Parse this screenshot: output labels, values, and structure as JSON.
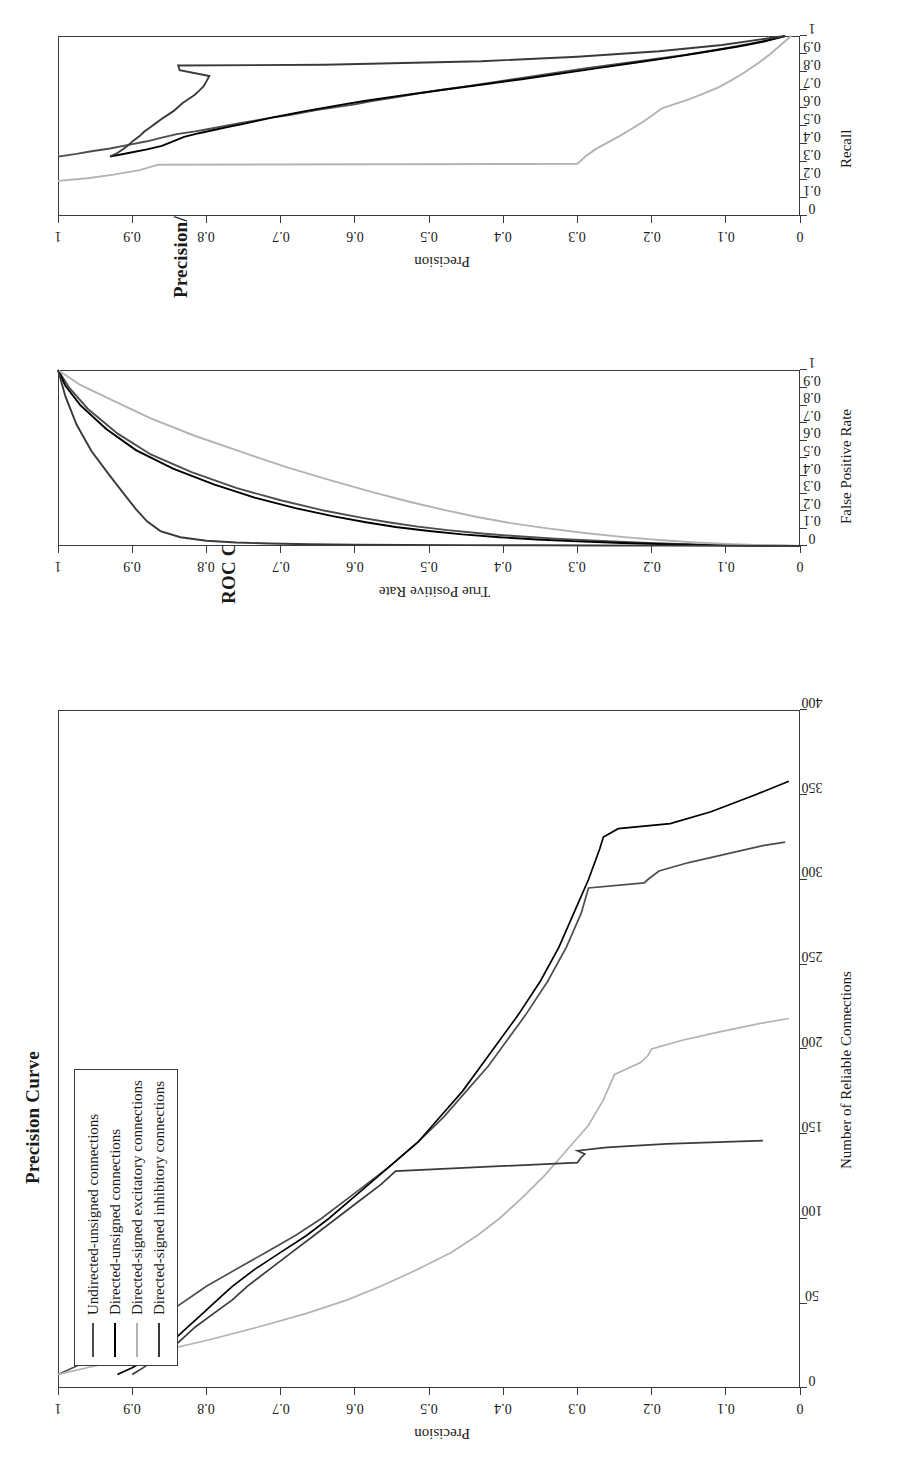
{
  "figure": {
    "orientation": "rotated-90-ccw",
    "background": "#ffffff",
    "ink": "#1a1a1a"
  },
  "legend": {
    "name": "series-legend",
    "items": [
      {
        "label": "Undirected-unsigned connections",
        "color": "#4d4d4d"
      },
      {
        "label": "Directed-unsigned connections",
        "color": "#000000"
      },
      {
        "label": "Directed-signed excitatory connections",
        "color": "#b3b3b3"
      },
      {
        "label": "Directed-signed inhibitory connections",
        "color": "#3a3a3a"
      }
    ]
  },
  "chart_data": [
    {
      "id": "precision-curve",
      "type": "line",
      "title": "Precision Curve",
      "xlabel": "Number of Reliable Connections",
      "ylabel": "Precision",
      "xlim": [
        0,
        400
      ],
      "ylim": [
        0,
        1
      ],
      "xticks": [
        "0",
        "50",
        "100",
        "150",
        "200",
        "250",
        "300",
        "350",
        "400"
      ],
      "yticks": [
        "0",
        "0.1",
        "0.2",
        "0.3",
        "0.4",
        "0.5",
        "0.6",
        "0.7",
        "0.8",
        "0.9",
        "1"
      ],
      "grid": false,
      "legend_position": "top-left",
      "series": [
        {
          "name": "Undirected-unsigned connections",
          "color": "#4d4d4d",
          "x": [
            8,
            12,
            18,
            24,
            30,
            36,
            42,
            48,
            54,
            60,
            70,
            80,
            90,
            100,
            115,
            130,
            145,
            160,
            175,
            190,
            205,
            220,
            240,
            260,
            280,
            295,
            298,
            300,
            305,
            310,
            315,
            320,
            322
          ],
          "y": [
            1.0,
            0.98,
            0.95,
            0.93,
            0.9,
            0.88,
            0.86,
            0.84,
            0.82,
            0.8,
            0.76,
            0.72,
            0.68,
            0.645,
            0.6,
            0.555,
            0.515,
            0.48,
            0.45,
            0.42,
            0.395,
            0.37,
            0.34,
            0.315,
            0.295,
            0.285,
            0.21,
            0.205,
            0.19,
            0.15,
            0.1,
            0.05,
            0.02
          ]
        },
        {
          "name": "Directed-unsigned connections",
          "color": "#000000",
          "x": [
            8,
            12,
            18,
            24,
            30,
            36,
            42,
            48,
            54,
            60,
            70,
            80,
            90,
            100,
            115,
            130,
            145,
            160,
            175,
            190,
            205,
            220,
            240,
            260,
            280,
            300,
            318,
            325,
            330,
            333,
            340,
            350,
            358
          ],
          "y": [
            0.92,
            0.9,
            0.875,
            0.855,
            0.84,
            0.825,
            0.81,
            0.795,
            0.78,
            0.765,
            0.735,
            0.7,
            0.665,
            0.635,
            0.595,
            0.555,
            0.515,
            0.485,
            0.455,
            0.43,
            0.405,
            0.38,
            0.35,
            0.325,
            0.305,
            0.285,
            0.27,
            0.265,
            0.245,
            0.175,
            0.12,
            0.06,
            0.015
          ]
        },
        {
          "name": "Directed-signed excitatory connections",
          "color": "#b3b3b3",
          "x": [
            8,
            14,
            20,
            28,
            36,
            44,
            52,
            60,
            70,
            80,
            90,
            100,
            112,
            125,
            140,
            155,
            170,
            185,
            192,
            196,
            200,
            205,
            210,
            215,
            218
          ],
          "y": [
            1.0,
            0.94,
            0.88,
            0.8,
            0.73,
            0.665,
            0.61,
            0.565,
            0.515,
            0.47,
            0.435,
            0.405,
            0.375,
            0.345,
            0.315,
            0.285,
            0.265,
            0.25,
            0.215,
            0.205,
            0.2,
            0.16,
            0.11,
            0.055,
            0.015
          ]
        },
        {
          "name": "Directed-signed inhibitory connections",
          "color": "#3a3a3a",
          "x": [
            8,
            12,
            18,
            24,
            30,
            36,
            44,
            52,
            60,
            70,
            80,
            90,
            100,
            110,
            120,
            128,
            133,
            136,
            138,
            140,
            142,
            144,
            146
          ],
          "y": [
            0.9,
            0.885,
            0.865,
            0.845,
            0.83,
            0.815,
            0.79,
            0.765,
            0.745,
            0.715,
            0.685,
            0.655,
            0.625,
            0.595,
            0.565,
            0.545,
            0.3,
            0.295,
            0.29,
            0.3,
            0.26,
            0.18,
            0.05
          ]
        }
      ]
    },
    {
      "id": "roc-curve",
      "type": "line",
      "title": "ROC Curve",
      "xlabel": "False Positive Rate",
      "ylabel": "True Positive Rate",
      "xlim": [
        0,
        1
      ],
      "ylim": [
        0,
        1
      ],
      "xticks": [
        "0",
        "0.1",
        "0.2",
        "0.3",
        "0.4",
        "0.5",
        "0.6",
        "0.7",
        "0.8",
        "0.9",
        "1"
      ],
      "yticks": [
        "0",
        "0.1",
        "0.2",
        "0.3",
        "0.4",
        "0.5",
        "0.6",
        "0.7",
        "0.8",
        "0.9",
        "1"
      ],
      "grid": false,
      "series": [
        {
          "name": "Undirected-unsigned connections",
          "color": "#4d4d4d",
          "x": [
            0.0,
            0.002,
            0.006,
            0.012,
            0.02,
            0.03,
            0.042,
            0.055,
            0.07,
            0.09,
            0.11,
            0.135,
            0.16,
            0.2,
            0.26,
            0.33,
            0.42,
            0.52,
            0.64,
            0.78,
            0.9,
            1.0
          ],
          "y": [
            0.0,
            0.055,
            0.11,
            0.165,
            0.22,
            0.275,
            0.33,
            0.38,
            0.425,
            0.475,
            0.515,
            0.555,
            0.59,
            0.64,
            0.7,
            0.76,
            0.82,
            0.875,
            0.92,
            0.96,
            0.985,
            1.0
          ]
        },
        {
          "name": "Directed-unsigned connections",
          "color": "#000000",
          "x": [
            0.0,
            0.002,
            0.005,
            0.01,
            0.017,
            0.026,
            0.037,
            0.05,
            0.066,
            0.085,
            0.108,
            0.135,
            0.17,
            0.215,
            0.275,
            0.35,
            0.44,
            0.545,
            0.665,
            0.8,
            0.91,
            1.0
          ],
          "y": [
            0.0,
            0.06,
            0.12,
            0.18,
            0.24,
            0.3,
            0.355,
            0.405,
            0.455,
            0.5,
            0.545,
            0.585,
            0.63,
            0.68,
            0.735,
            0.79,
            0.845,
            0.895,
            0.935,
            0.97,
            0.99,
            1.0
          ]
        },
        {
          "name": "Directed-signed excitatory connections",
          "color": "#b3b3b3",
          "x": [
            0.0,
            0.004,
            0.01,
            0.02,
            0.034,
            0.052,
            0.074,
            0.1,
            0.13,
            0.165,
            0.205,
            0.25,
            0.305,
            0.37,
            0.445,
            0.53,
            0.625,
            0.725,
            0.825,
            0.915,
            1.0
          ],
          "y": [
            0.0,
            0.045,
            0.09,
            0.14,
            0.19,
            0.24,
            0.29,
            0.34,
            0.39,
            0.435,
            0.48,
            0.525,
            0.575,
            0.63,
            0.69,
            0.75,
            0.815,
            0.875,
            0.925,
            0.97,
            1.0
          ]
        },
        {
          "name": "Directed-signed inhibitory connections",
          "color": "#3a3a3a",
          "x": [
            0.0,
            0.001,
            0.002,
            0.003,
            0.004,
            0.005,
            0.006,
            0.008,
            0.01,
            0.014,
            0.02,
            0.03,
            0.05,
            0.085,
            0.14,
            0.21,
            0.3,
            0.41,
            0.54,
            0.69,
            0.85,
            1.0
          ],
          "y": [
            0.0,
            0.09,
            0.18,
            0.27,
            0.36,
            0.45,
            0.53,
            0.6,
            0.66,
            0.715,
            0.76,
            0.8,
            0.835,
            0.862,
            0.88,
            0.895,
            0.912,
            0.932,
            0.955,
            0.975,
            0.99,
            1.0
          ]
        }
      ]
    },
    {
      "id": "precision-recall-curve",
      "type": "line",
      "title": "Precision/Recall Curve",
      "xlabel": "Recall",
      "ylabel": "Precision",
      "xlim": [
        0,
        1
      ],
      "ylim": [
        0,
        1
      ],
      "xticks": [
        "0",
        "0.1",
        "0.2",
        "0.3",
        "0.4",
        "0.5",
        "0.6",
        "0.7",
        "0.8",
        "0.9",
        "1"
      ],
      "yticks": [
        "0",
        "0.1",
        "0.2",
        "0.3",
        "0.4",
        "0.5",
        "0.6",
        "0.7",
        "0.8",
        "0.9",
        "1"
      ],
      "grid": false,
      "series": [
        {
          "name": "Undirected-unsigned connections",
          "color": "#4d4d4d",
          "x": [
            0.33,
            0.345,
            0.36,
            0.375,
            0.395,
            0.415,
            0.435,
            0.455,
            0.47,
            0.485,
            0.5,
            0.515,
            0.53,
            0.545,
            0.56,
            0.575,
            0.59,
            0.605,
            0.62,
            0.64,
            0.66,
            0.68,
            0.7,
            0.72,
            0.745,
            0.77,
            0.795,
            0.82,
            0.845,
            0.87,
            0.895,
            0.925,
            0.955,
            0.98,
            1.0
          ],
          "y": [
            1.0,
            0.975,
            0.955,
            0.93,
            0.905,
            0.88,
            0.86,
            0.84,
            0.815,
            0.795,
            0.775,
            0.755,
            0.735,
            0.715,
            0.69,
            0.67,
            0.65,
            0.625,
            0.6,
            0.575,
            0.545,
            0.515,
            0.485,
            0.45,
            0.41,
            0.37,
            0.33,
            0.29,
            0.245,
            0.2,
            0.155,
            0.11,
            0.07,
            0.04,
            0.02
          ]
        },
        {
          "name": "Directed-unsigned connections",
          "color": "#000000",
          "x": [
            0.33,
            0.35,
            0.37,
            0.39,
            0.415,
            0.44,
            0.46,
            0.478,
            0.495,
            0.512,
            0.53,
            0.548,
            0.566,
            0.584,
            0.602,
            0.62,
            0.64,
            0.662,
            0.685,
            0.71,
            0.735,
            0.76,
            0.79,
            0.82,
            0.85,
            0.88,
            0.91,
            0.94,
            0.968,
            1.0
          ],
          "y": [
            0.93,
            0.905,
            0.88,
            0.86,
            0.845,
            0.83,
            0.81,
            0.79,
            0.77,
            0.75,
            0.73,
            0.71,
            0.688,
            0.665,
            0.64,
            0.615,
            0.585,
            0.55,
            0.51,
            0.465,
            0.42,
            0.375,
            0.325,
            0.275,
            0.225,
            0.175,
            0.13,
            0.085,
            0.05,
            0.02
          ]
        },
        {
          "name": "Directed-signed excitatory connections",
          "color": "#b3b3b3",
          "x": [
            0.195,
            0.21,
            0.23,
            0.255,
            0.285,
            0.29,
            0.305,
            0.32,
            0.335,
            0.352,
            0.37,
            0.388,
            0.406,
            0.424,
            0.442,
            0.462,
            0.482,
            0.502,
            0.522,
            0.542,
            0.562,
            0.58,
            0.598,
            0.62,
            0.648,
            0.68,
            0.715,
            0.755,
            0.8,
            0.85,
            0.9,
            0.95,
            1.0
          ],
          "y": [
            1.0,
            0.96,
            0.925,
            0.89,
            0.865,
            0.3,
            0.296,
            0.292,
            0.288,
            0.282,
            0.276,
            0.268,
            0.26,
            0.252,
            0.244,
            0.236,
            0.228,
            0.22,
            0.212,
            0.205,
            0.198,
            0.192,
            0.186,
            0.17,
            0.15,
            0.13,
            0.11,
            0.092,
            0.074,
            0.056,
            0.04,
            0.026,
            0.012
          ]
        },
        {
          "name": "Directed-signed inhibitory connections",
          "color": "#3a3a3a",
          "x": [
            0.33,
            0.35,
            0.372,
            0.395,
            0.42,
            0.444,
            0.468,
            0.492,
            0.516,
            0.54,
            0.562,
            0.584,
            0.606,
            0.628,
            0.65,
            0.672,
            0.695,
            0.72,
            0.748,
            0.778,
            0.81,
            0.836,
            0.84,
            0.86,
            0.885,
            0.915,
            0.95,
            0.98,
            1.0
          ],
          "y": [
            0.93,
            0.92,
            0.912,
            0.905,
            0.898,
            0.89,
            0.884,
            0.876,
            0.868,
            0.86,
            0.852,
            0.844,
            0.838,
            0.832,
            0.824,
            0.816,
            0.81,
            0.804,
            0.8,
            0.796,
            0.836,
            0.838,
            0.64,
            0.43,
            0.3,
            0.19,
            0.105,
            0.055,
            0.02
          ]
        }
      ]
    }
  ]
}
